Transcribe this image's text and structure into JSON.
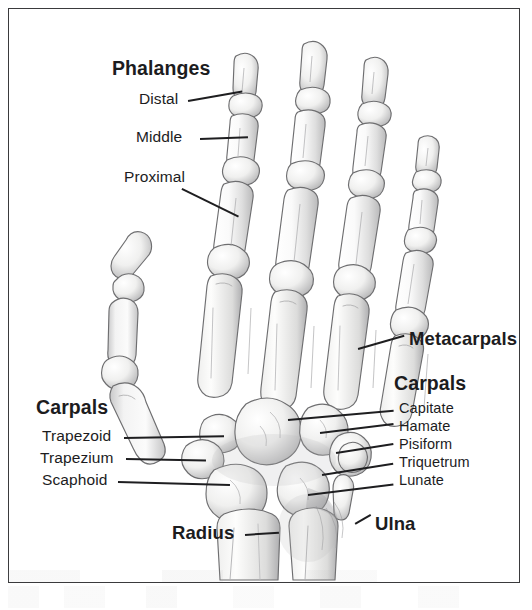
{
  "figure": {
    "background_color": "#ffffff",
    "border_color": "#3a3a3c",
    "ink_color": "#1c1c1e",
    "bone_fill": "#fbfbfa",
    "bone_outline": "#6e6e70",
    "shading_color": "#9a9a9c"
  },
  "groups": {
    "phalanges_heading": "Phalanges",
    "carpals_left_heading": "Carpals",
    "carpals_right_heading": "Carpals"
  },
  "labels": {
    "phalanges": "Phalanges",
    "distal": "Distal",
    "middle": "Middle",
    "proximal": "Proximal",
    "metacarpals": "Metacarpals",
    "carpals_left": "Carpals",
    "trapezoid": "Trapezoid",
    "trapezium": "Trapezium",
    "scaphoid": "Scaphoid",
    "carpals_right": "Carpals",
    "capitate": "Capitate",
    "hamate": "Hamate",
    "pisiform": "Pisiform",
    "triquetrum": "Triquetrum",
    "lunate": "Lunate",
    "radius": "Radius",
    "ulna": "Ulna"
  },
  "bones_depicted": {
    "phalanges": [
      "Distal",
      "Middle",
      "Proximal"
    ],
    "metacarpals_count": 5,
    "carpals": [
      "Trapezoid",
      "Trapezium",
      "Scaphoid",
      "Capitate",
      "Hamate",
      "Pisiform",
      "Triquetrum",
      "Lunate"
    ],
    "forearm": [
      "Radius",
      "Ulna"
    ]
  }
}
